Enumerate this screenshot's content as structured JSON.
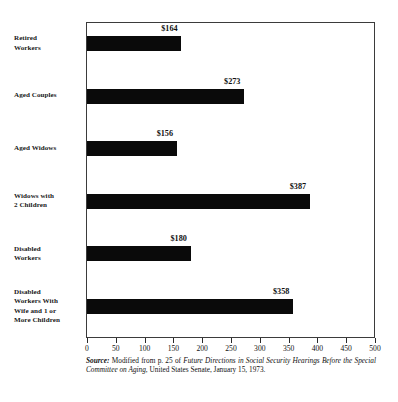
{
  "chart_data": {
    "type": "bar",
    "orientation": "horizontal",
    "title": "",
    "xlabel": "",
    "ylabel": "",
    "xlim": [
      0,
      500
    ],
    "xticks": [
      0,
      50,
      100,
      150,
      200,
      250,
      300,
      350,
      400,
      450,
      500
    ],
    "xtick_labels": [
      "0",
      "50",
      "100",
      "150",
      "200",
      "250",
      "300",
      "350",
      "400",
      "450",
      "500"
    ],
    "grid": false,
    "legend": false,
    "bar_color": "#0a0a0a",
    "categories": [
      "Retired Workers",
      "Aged Couples",
      "Aged Widows",
      "Widows with 2 Children",
      "Disabled Workers",
      "Disabled Workers With Wife and 1 or More Children"
    ],
    "values": [
      164,
      273,
      156,
      387,
      180,
      358
    ],
    "value_labels": [
      "$164",
      "$273",
      "$156",
      "$387",
      "$180",
      "$358"
    ],
    "category_label_lines": [
      [
        "Retired",
        "Workers"
      ],
      [
        "Aged Couples"
      ],
      [
        "Aged Widows"
      ],
      [
        "Widows with",
        "2 Children"
      ],
      [
        "Disabled",
        "Workers"
      ],
      [
        "Disabled",
        "Workers With",
        "Wife and 1 or",
        "More Children"
      ]
    ]
  },
  "source_note": {
    "label": "Source:",
    "text_before_title": " Modified from p. 25 of ",
    "title": "Future Directions in Social Security Hearings Before the Special Committee on Aging",
    "text_after_title": ", United States Senate, January 15, 1973."
  }
}
